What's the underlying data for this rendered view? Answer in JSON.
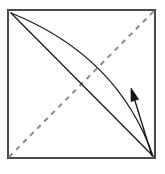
{
  "figure": {
    "name": "origami-fold-diagram",
    "canvas": {
      "width": 165,
      "height": 174,
      "background": "#ffffff"
    },
    "colors": {
      "sheet_border": "#4a4a4a",
      "sheet_fill": "#ffffff",
      "crease_valley_dashed": "#8a8a8a",
      "fold_edge_solid": "#1a1a1a",
      "arrow": "#111111"
    },
    "sheet": {
      "label": "paper-square",
      "x": 8,
      "y": 10,
      "width": 147,
      "height": 148,
      "stroke_width": 2.2,
      "corners": {
        "top_left": [
          8,
          10
        ],
        "top_right": [
          155,
          10
        ],
        "bottom_right": [
          155,
          158
        ],
        "bottom_left": [
          8,
          158
        ]
      }
    },
    "dashed_crease": {
      "label": "diagonal-crease-line",
      "from": [
        8,
        158
      ],
      "to": [
        155,
        10
      ],
      "dash_pattern": "5 5",
      "stroke_width": 2.0,
      "style": "dashed"
    },
    "solid_diagonal": {
      "label": "folded-edge-straight",
      "from": [
        11,
        13
      ],
      "to": [
        153,
        156
      ],
      "stroke_width": 1.3,
      "style": "solid"
    },
    "curved_edge": {
      "label": "folded-edge-curved",
      "from": [
        11,
        13
      ],
      "control": [
        118,
        56
      ],
      "to": [
        153,
        156
      ],
      "stroke_width": 1.3,
      "style": "solid-curve"
    },
    "arrow": {
      "label": "fold-direction-arrow",
      "tail": [
        152,
        156
      ],
      "head_tip": [
        131,
        88
      ],
      "shaft_width": 1.3,
      "head_length": 13,
      "head_width": 8,
      "direction": "up-left"
    }
  }
}
